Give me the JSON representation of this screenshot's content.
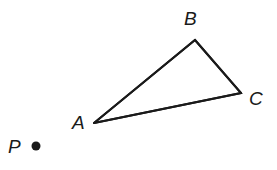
{
  "figure": {
    "background_color": "#ffffff",
    "stroke_color": "#1a1a1a",
    "stroke_width": 2,
    "width": 277,
    "height": 170,
    "triangle": {
      "name": "triangle-ABC",
      "vertices": [
        {
          "label": "A",
          "x": 94,
          "y": 123,
          "label_x": 72,
          "label_y": 113
        },
        {
          "label": "B",
          "x": 195,
          "y": 40,
          "label_x": 184,
          "label_y": 9
        },
        {
          "label": "C",
          "x": 241,
          "y": 93,
          "label_x": 249,
          "label_y": 89
        }
      ],
      "edges": [
        {
          "name": "segment-AB",
          "from": "A",
          "to": "B"
        },
        {
          "name": "segment-BC",
          "from": "B",
          "to": "C"
        },
        {
          "name": "segment-CA",
          "from": "C",
          "to": "A"
        }
      ],
      "path": "M 94 123 L 195 40 L 241 93 Z"
    },
    "points": [
      {
        "label": "P",
        "x": 36,
        "y": 146,
        "radius": 4.5,
        "fill": "#1a1a1a",
        "label_x": 8,
        "label_y": 137
      }
    ]
  },
  "labels": {
    "A": "A",
    "B": "B",
    "C": "C",
    "P": "P"
  }
}
